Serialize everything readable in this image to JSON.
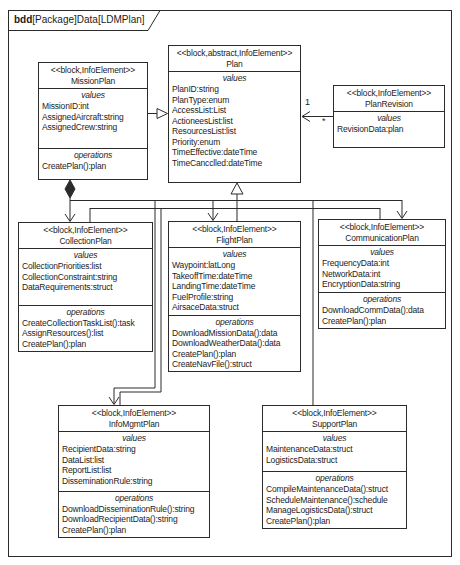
{
  "frame": {
    "title_keyword": "bdd",
    "title_rest": "[Package]Data[LDMPlan]"
  },
  "labels": {
    "values": "values",
    "operations": "operations"
  },
  "blocks": [
    {
      "id": "mission-plan",
      "stereotype": "<<block,InfoElement>>",
      "name": "MissionPlan",
      "values": [
        "MissionID:int",
        "AssignedAircraft:string",
        "AssignedCrew:string"
      ],
      "operations": [
        "CreatePlan():plan"
      ]
    },
    {
      "id": "plan",
      "stereotype": "<<block,abstract,InfoElement>>",
      "name": "Plan",
      "values": [
        "PlanID:string",
        "PlanType:enum",
        "AccessList:List",
        "ActioneesList:list",
        "ResourcesList:list",
        "Priority:enum",
        "TimeEffective:dateTime",
        "TimeCancclled:dateTime"
      ],
      "operations": []
    },
    {
      "id": "plan-revision",
      "stereotype": "<<block,InfoElement>>",
      "name": "PlanRevision",
      "values": [
        "RevisionData:plan"
      ],
      "operations": []
    },
    {
      "id": "collection-plan",
      "stereotype": "<<block,InfoElement>>",
      "name": "CollectionPlan",
      "values": [
        "CollectionPriorities:list",
        "CollectionConstraint:string",
        "DataRequirements:struct"
      ],
      "operations": [
        "CreateCollectionTaskList():task",
        "AssignResources():list",
        "CreatePlan():plan"
      ]
    },
    {
      "id": "flight-plan",
      "stereotype": "<<block,InfoElement>>",
      "name": "FlightPlan",
      "values": [
        "Waypoint:latLong",
        "TakeoffTime:dateTime",
        "LandingTime:dateTime",
        "FuelProfile:string",
        "AirsaceData:struct"
      ],
      "operations": [
        "DownloadMissionData():data",
        "DownloadWeatherData():data",
        "CreatePlan():plan",
        "CreateNavFile():struct"
      ]
    },
    {
      "id": "communication-plan",
      "stereotype": "<<block,InfoElement>>",
      "name": "CommunicationPlan",
      "values": [
        "FrequencyData:int",
        "NetworkData:int",
        "EncryptionData:string"
      ],
      "operations": [
        "DownloadCommData():data",
        "CreatePlan():plan"
      ]
    },
    {
      "id": "info-mgmt-plan",
      "stereotype": "<<block,InfoElement>>",
      "name": "InfoMgmtPlan",
      "values": [
        "RecipientData:string",
        "DataList:list",
        "ReportList:list",
        "DisseminationRule:string"
      ],
      "operations": [
        "DownloadDisseminationRule():string",
        "DownloadRecipientData():string",
        "CreatePlan():plan"
      ]
    },
    {
      "id": "support-plan",
      "stereotype": "<<block,InfoElement>>",
      "name": "SupportPlan",
      "values": [
        "MaintenanceData:struct",
        "LogisticsData:struct"
      ],
      "operations": [
        "CompileMaintenanceData():struct",
        "ScheduleMaintenance():schedule",
        "ManageLogisticsData():struct",
        "CreatePlan():plan"
      ]
    }
  ],
  "connectors": {
    "plan_revision_mult_plan_end": "1",
    "plan_revision_mult_revision_end": "*"
  }
}
